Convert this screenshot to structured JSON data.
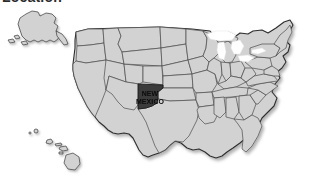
{
  "heading": {
    "text": "Location"
  },
  "map": {
    "title": "United States map with state highlighted",
    "highlighted_state_label_line1": "NEW",
    "highlighted_state_label_line2": "MEXICO",
    "highlighted_state_name": "New Mexico",
    "colors": {
      "background": "#ffffff",
      "state_fill": "#d2d2d2",
      "state_border": "#4c4c4c",
      "outer_border": "#2e2e2e",
      "highlight_fill": "#3b3b3b",
      "highlight_border": "#1c1c1c",
      "lake_fill": "#ffffff",
      "label_text": "#0a0a0a",
      "heading_text": "#2b2b2b",
      "shadow": "rgba(0,0,0,0.22)"
    },
    "insets": {
      "alaska": "Alaska",
      "hawaii": "Hawaii"
    },
    "features": [
      "contiguous-united-states",
      "great-lakes",
      "alaska-inset",
      "hawaii-inset"
    ]
  }
}
